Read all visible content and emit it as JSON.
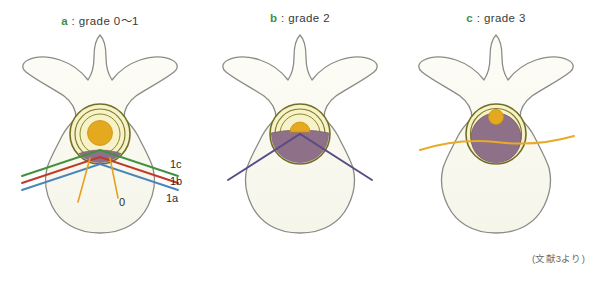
{
  "figure": {
    "caption_source": "(文献3より)",
    "background_color": "#ffffff"
  },
  "panels": [
    {
      "id": "a",
      "letter": "a",
      "separator": " : ",
      "title_text": "grade 0～1",
      "full_title": "a : grade 0～1",
      "letter_color": "#3f8f4a",
      "description": "Axial lumbar vertebra with spinal canal rings, central amber cord and thin mauve disc crescent; three straight classification lines plus two orange fan lines.",
      "canal": {
        "ring_color": "#7d7c2a",
        "ring_fill": "#f7f2c8",
        "cord_color": "#e5a920",
        "cord_radius": 12,
        "mass_color": "#96708f",
        "mass_level": "minimal"
      },
      "lines": [
        {
          "name": "1c",
          "color": "#3f9140",
          "label": "1c"
        },
        {
          "name": "1b",
          "color": "#c0392b",
          "label": "1b"
        },
        {
          "name": "1a",
          "color": "#4a86b8",
          "label": "1a"
        },
        {
          "name": "0",
          "color": "#e3a321",
          "label": "0"
        }
      ]
    },
    {
      "id": "b",
      "letter": "b",
      "separator": " : ",
      "title_text": "grade 2",
      "full_title": "b : grade 2",
      "letter_color": "#3f8f4a",
      "description": "Spinal canal about half filled by mauve mass, amber cord compressed to upper半; single violet line crosses the canal.",
      "canal": {
        "ring_color": "#7d7c2a",
        "ring_fill": "#f7f2c8",
        "cord_color": "#e5a920",
        "cord_radius": 9,
        "mass_color": "#96708f",
        "mass_level": "half"
      },
      "lines": [
        {
          "name": "grade2-line",
          "color": "#5b4a86",
          "label": ""
        }
      ]
    },
    {
      "id": "c",
      "letter": "c",
      "separator": " : ",
      "title_text": "grade 3",
      "full_title": "c : grade 3",
      "letter_color": "#3f8f4a",
      "description": "Spinal canal nearly completely filled by mauve mass, only a small amber cord remains at top; single orange line crosses the canal.",
      "canal": {
        "ring_color": "#7d7c2a",
        "ring_fill": "#f7f2c8",
        "cord_color": "#e5a920",
        "cord_radius": 7,
        "mass_color": "#96708f",
        "mass_level": "full"
      },
      "lines": [
        {
          "name": "grade3-line",
          "color": "#e8aa28",
          "label": ""
        }
      ]
    }
  ],
  "labels": {
    "line_1c": "1c",
    "line_1b": "1b",
    "line_1a": "1a",
    "line_0": "0"
  },
  "colors": {
    "bone_fill": "#fbfaf2",
    "bone_stroke": "#8b8b86",
    "canal_ring": "#7d7c2a",
    "canal_fill": "#f7f2c8",
    "cord_amber": "#e5a920",
    "mass_mauve": "#96708f",
    "line_green": "#3f9140",
    "line_red": "#c0392b",
    "line_blue": "#4a86b8",
    "line_orange": "#e3a321",
    "line_violet": "#5b4a86",
    "letter_green": "#3f8f4a",
    "text_dark": "#2b2b2b",
    "note_gray": "#6a6a6a"
  }
}
